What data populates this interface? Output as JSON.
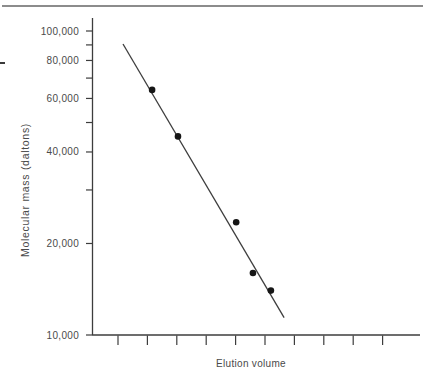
{
  "page": {
    "background": "#ffffff",
    "decorations": {
      "top_rule_color": "#8c8c8c",
      "left_margin_dash_color": "#3a3a3a"
    }
  },
  "chart_data": {
    "type": "scatter",
    "title": "",
    "xlabel": "Elution volume",
    "ylabel": "Molecular mass (daltons)",
    "x_scale": "linear",
    "y_scale": "log",
    "ylim": [
      10000,
      100000
    ],
    "x_tick_count": 10,
    "x_tick_units": [
      1,
      2,
      3,
      4,
      5,
      6,
      7,
      8,
      9,
      10
    ],
    "x_tick_labels_visible": false,
    "y_tick_values": [
      10000,
      20000,
      30000,
      40000,
      50000,
      60000,
      70000,
      80000,
      90000,
      100000
    ],
    "y_axis_labels": [
      {
        "value": 10000,
        "label": "10,000"
      },
      {
        "value": 20000,
        "label": "20,000"
      },
      {
        "value": 40000,
        "label": "40,000"
      },
      {
        "value": 60000,
        "label": "60,000"
      },
      {
        "value": 80000,
        "label": "80,000"
      },
      {
        "value": 100000,
        "label": "100,000"
      }
    ],
    "grid": "off",
    "legend": "none",
    "series": [
      {
        "name": "calibration-points",
        "marker": "filled-circle",
        "points": [
          {
            "x": 2.16,
            "y": 64000
          },
          {
            "x": 3.04,
            "y": 45000
          },
          {
            "x": 5.02,
            "y": 23500
          },
          {
            "x": 5.59,
            "y": 16000
          },
          {
            "x": 6.2,
            "y": 14000
          }
        ]
      }
    ],
    "fit_line": {
      "x1": 1.17,
      "y1": 90600,
      "x2": 6.65,
      "y2": 11400
    },
    "colors": {
      "axis": "#3d3d3d",
      "points": "#161616",
      "fit_line": "#3d3d3d",
      "tick_label": "#4a4a4a",
      "axis_label": "#4a4a4a"
    }
  }
}
